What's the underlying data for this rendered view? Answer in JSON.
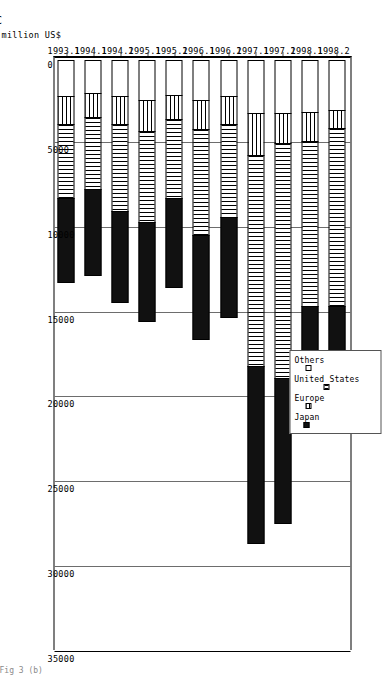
{
  "chart_data": {
    "type": "bar",
    "orientation": "horizontal-stacked",
    "title": "",
    "xlabel": "",
    "ylabel": "million US$",
    "ylim": [
      0,
      35000
    ],
    "ytick_labels": [
      "0",
      "5000",
      "10000",
      "15000",
      "20000",
      "25000",
      "30000",
      "35000"
    ],
    "ytick_values": [
      0,
      5000,
      10000,
      15000,
      20000,
      25000,
      30000,
      35000
    ],
    "grid": true,
    "legend_position": "top-center",
    "categories": [
      "1993.1",
      "1994.1",
      "1994.2",
      "1995.1",
      "1995.2",
      "1996.1",
      "1996.2",
      "1997.1",
      "1997.2",
      "1998.1",
      "1998.2"
    ],
    "series": [
      {
        "name": "Japan",
        "values": [
          5000,
          5100,
          5400,
          5900,
          5300,
          6200,
          6000,
          10500,
          8600,
          7200,
          6500
        ]
      },
      {
        "name": "United States",
        "values": [
          4400,
          4300,
          5200,
          5400,
          4700,
          6300,
          5500,
          12500,
          13900,
          9800,
          10600
        ]
      },
      {
        "name": "Europe",
        "values": [
          1700,
          1500,
          1700,
          1900,
          1500,
          1800,
          1700,
          2500,
          1800,
          1800,
          1100
        ]
      },
      {
        "name": "Others",
        "values": [
          2200,
          2000,
          2200,
          2400,
          2100,
          2400,
          2200,
          3200,
          3200,
          3100,
          3000
        ]
      }
    ],
    "totals": [
      13300,
      12900,
      14500,
      15600,
      13600,
      16700,
      15400,
      28700,
      27500,
      21900,
      21200
    ],
    "colors": {
      "japan": "#111111",
      "united_states": "#ffffff",
      "europe": "#ffffff",
      "others": "#ffffff",
      "gridline": "#6d6d6d",
      "axis": "#000000"
    }
  },
  "legend": {
    "items": [
      {
        "key": "others",
        "label": "Others"
      },
      {
        "key": "us",
        "label": "United States"
      },
      {
        "key": "europe",
        "label": "Europe"
      },
      {
        "key": "japan",
        "label": "Japan"
      }
    ]
  },
  "axis": {
    "value_title": "million US$"
  },
  "marks": {
    "corner": "C",
    "caption": "Fig 3  (b)"
  }
}
